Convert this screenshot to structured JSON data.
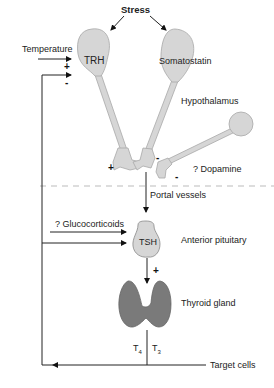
{
  "labels": {
    "stress": "Stress",
    "temperature": "Temperature",
    "trh": "TRH",
    "somatostatin": "Somatostatin",
    "hypothalamus": "Hypothalamus",
    "dopamine": "? Dopamine",
    "portal_vessels": "Portal vessels",
    "glucocorticoids": "? Glucocorticoids",
    "tsh": "TSH",
    "anterior_pituitary": "Anterior pituitary",
    "thyroid_gland": "Thyroid gland",
    "t4": "T",
    "t4_sub": "4",
    "t3": "T",
    "t3_sub": "3",
    "target_cells": "Target cells"
  },
  "signs": {
    "temperature_plus": "+",
    "feedback_minus_trh": "-",
    "trh_terminal_plus": "+",
    "somatostatin_terminal_minus": "-",
    "dopamine_terminal_minus": "-",
    "tsh_to_thyroid_plus": "+"
  },
  "colors": {
    "neuron_fill": "#d6d6d6",
    "neuron_stroke": "#a8a8a8",
    "thyroid_fill": "#7a7a7a",
    "line": "#222222",
    "dashed": "#bbbbbb"
  }
}
